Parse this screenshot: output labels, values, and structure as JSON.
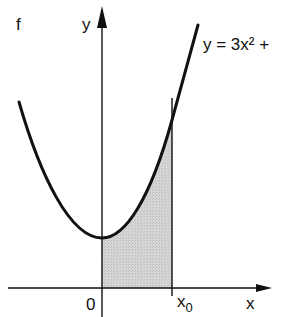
{
  "figure": {
    "corner_label": "f",
    "y_axis_label": "y",
    "x_axis_label": "x",
    "origin_label": "0",
    "x0_label": "x",
    "x0_subscript": "0",
    "equation": "y = 3x² +",
    "shade_color": "#cfcfcf",
    "line_color": "#111111"
  }
}
